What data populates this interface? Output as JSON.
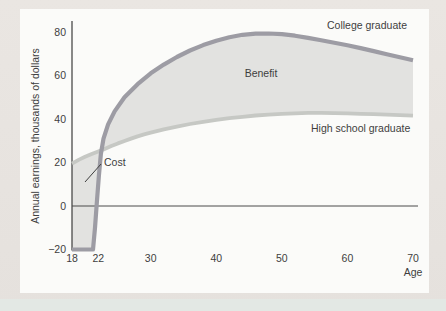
{
  "figure": {
    "background_color": "#e7e3de",
    "panel_color": "#fbfbf9",
    "bottom_band_color": "#e3e8e4"
  },
  "chart_data": {
    "type": "area",
    "title": "",
    "xlabel": "Age",
    "ylabel": "Annual earnings, thousands of dollars",
    "x_ticks": [
      18,
      22,
      30,
      40,
      50,
      60,
      70
    ],
    "y_ticks": [
      80,
      60,
      40,
      20,
      0,
      -20
    ],
    "y_tick_labels": [
      "80",
      "60",
      "40",
      "20",
      "0",
      "−20"
    ],
    "xlim": [
      18,
      72.5
    ],
    "ylim": [
      -26,
      88
    ],
    "grid": false,
    "axis_color": "#4a4a4a",
    "area_fill": "#e2e2e0",
    "series": [
      {
        "name": "College graduate",
        "color": "#9d9ca4",
        "stroke_width": 4.2,
        "points": [
          [
            18,
            -20
          ],
          [
            21.2,
            -20
          ],
          [
            21.5,
            -10
          ],
          [
            21.8,
            2
          ],
          [
            22.1,
            14
          ],
          [
            22.4,
            24
          ],
          [
            22.8,
            31
          ],
          [
            23.5,
            37.5
          ],
          [
            24.5,
            43.5
          ],
          [
            26,
            50
          ],
          [
            28,
            56
          ],
          [
            30,
            61
          ],
          [
            32,
            65
          ],
          [
            34,
            68.5
          ],
          [
            36,
            71.5
          ],
          [
            38,
            74
          ],
          [
            40,
            76
          ],
          [
            42,
            77.6
          ],
          [
            44,
            78.7
          ],
          [
            46,
            79.2
          ],
          [
            48,
            79.3
          ],
          [
            50,
            79
          ],
          [
            52,
            78.3
          ],
          [
            54,
            77.3
          ],
          [
            56,
            76.2
          ],
          [
            58,
            75.1
          ],
          [
            60,
            73.9
          ],
          [
            62,
            72.6
          ],
          [
            64,
            71.2
          ],
          [
            66,
            69.8
          ],
          [
            68,
            68.4
          ],
          [
            70,
            67
          ]
        ]
      },
      {
        "name": "High school graduate",
        "color": "#c6c8c4",
        "stroke_width": 3.8,
        "points": [
          [
            18,
            19.5
          ],
          [
            19,
            21.2
          ],
          [
            20,
            22.6
          ],
          [
            21,
            23.9
          ],
          [
            22,
            25.1
          ],
          [
            22.8,
            26
          ],
          [
            24,
            27.6
          ],
          [
            25,
            28.8
          ],
          [
            26,
            29.9
          ],
          [
            27,
            31
          ],
          [
            28,
            32
          ],
          [
            29,
            32.9
          ],
          [
            30,
            33.7
          ],
          [
            32,
            35.2
          ],
          [
            34,
            36.5
          ],
          [
            36,
            37.7
          ],
          [
            38,
            38.7
          ],
          [
            40,
            39.6
          ],
          [
            42,
            40.4
          ],
          [
            44,
            41
          ],
          [
            46,
            41.6
          ],
          [
            48,
            42
          ],
          [
            50,
            42.4
          ],
          [
            52,
            42.6
          ],
          [
            54,
            42.8
          ],
          [
            56,
            42.8
          ],
          [
            58,
            42.7
          ],
          [
            60,
            42.6
          ],
          [
            62,
            42.4
          ],
          [
            64,
            42.2
          ],
          [
            66,
            42
          ],
          [
            68,
            41.8
          ],
          [
            70,
            41.5
          ]
        ]
      }
    ],
    "regions": [
      {
        "name": "Cost",
        "description": "shaded area ages 18–22.6 between high school curve, y-axis, −20 line and rising college line"
      },
      {
        "name": "Benefit",
        "description": "shaded area between college and high school curves from ~age 22.6 to 70"
      }
    ],
    "annotations": [
      {
        "text": "College graduate"
      },
      {
        "text": "High school graduate"
      },
      {
        "text": "Benefit"
      },
      {
        "text": "Cost",
        "leader_line": true
      }
    ]
  }
}
